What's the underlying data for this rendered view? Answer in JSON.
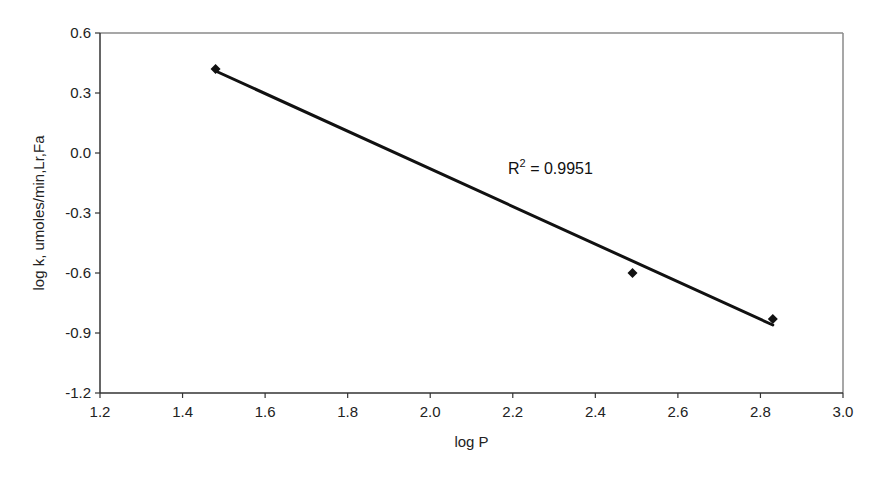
{
  "chart_data": {
    "type": "scatter",
    "title": "",
    "xlabel": "log P",
    "ylabel": "log k, umoles/min,Lr,Fa",
    "xlim": [
      1.2,
      3.0
    ],
    "ylim": [
      -1.2,
      0.6
    ],
    "x_ticks": [
      1.2,
      1.4,
      1.6,
      1.8,
      2.0,
      2.2,
      2.4,
      2.6,
      2.8,
      3.0
    ],
    "x_tick_labels": [
      "1.2",
      "1.4",
      "1.6",
      "1.8",
      "2.0",
      "2.2",
      "2.4",
      "2.6",
      "2.8",
      "3.0"
    ],
    "y_ticks": [
      0.6,
      0.3,
      0.0,
      -0.3,
      -0.6,
      -0.9,
      -1.2
    ],
    "y_tick_labels": [
      "0.6",
      "0.3",
      "0.0",
      "-0.3",
      "-0.6",
      "-0.9",
      "-1.2"
    ],
    "grid": false,
    "legend": null,
    "series": [
      {
        "name": "data",
        "marker": "diamond",
        "color": "#111111",
        "x": [
          1.48,
          2.49,
          2.83
        ],
        "y": [
          0.42,
          -0.6,
          -0.83
        ]
      }
    ],
    "trendline": {
      "type": "linear",
      "color": "#111111",
      "x": [
        1.48,
        2.83
      ],
      "y": [
        0.41,
        -0.86
      ],
      "r_squared": 0.9951
    },
    "annotations": [
      {
        "text_main": "R",
        "text_sup": "2",
        "text_rest": " = 0.9951",
        "x": 2.2,
        "y": -0.05
      }
    ]
  }
}
